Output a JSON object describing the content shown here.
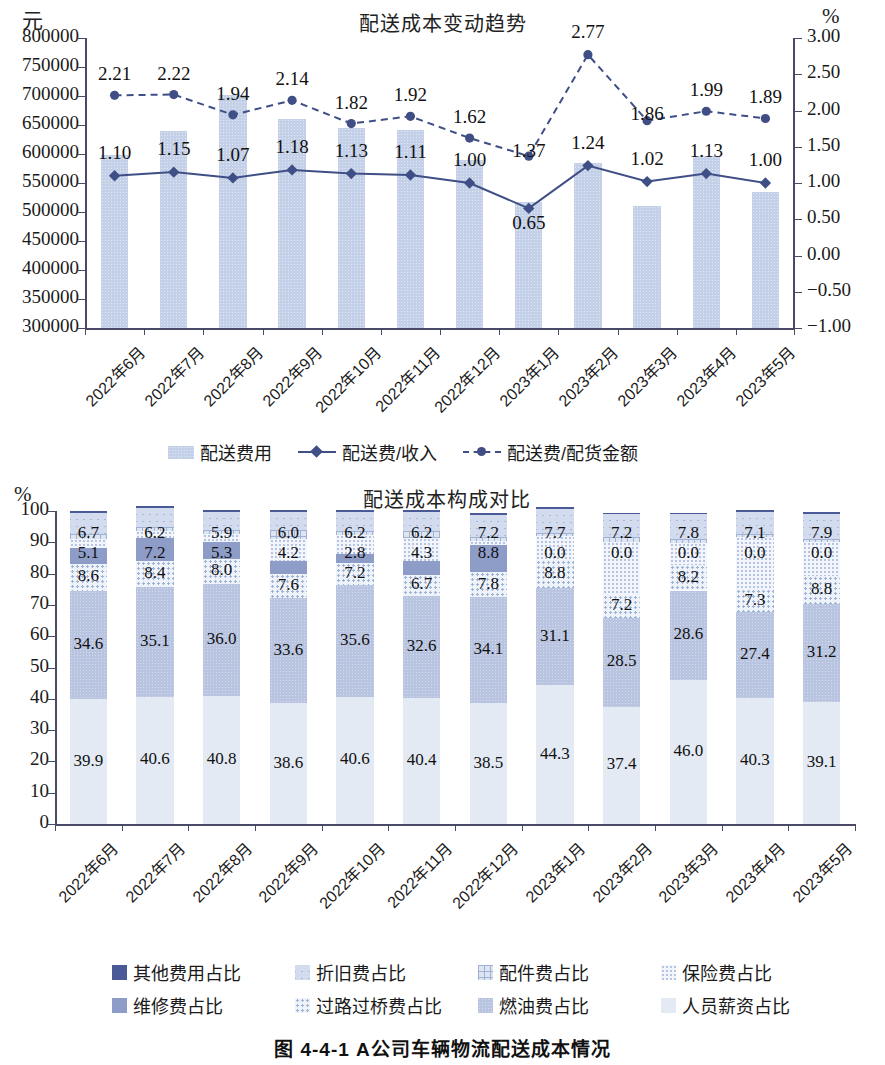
{
  "caption": "图 4-4-1    A公司车辆物流配送成本情况",
  "chart_data": [
    {
      "type": "bar",
      "title": "配送成本变动趋势",
      "xlabel": "",
      "ylabel": "元",
      "y2label": "%",
      "ylim": [
        300000,
        800000
      ],
      "yticks": [
        "300000",
        "350000",
        "400000",
        "450000",
        "500000",
        "550000",
        "600000",
        "650000",
        "700000",
        "750000",
        "800000"
      ],
      "y2lim": [
        -1.0,
        3.0
      ],
      "y2ticks": [
        "-1.00",
        "-0.50",
        "0.00",
        "0.50",
        "1.00",
        "1.50",
        "2.00",
        "2.50",
        "3.00"
      ],
      "grid": false,
      "legend_position": "bottom",
      "categories": [
        "2022年6月",
        "2022年7月",
        "2022年8月",
        "2022年9月",
        "2022年10月",
        "2022年11月",
        "2022年12月",
        "2023年1月",
        "2023年2月",
        "2023年3月",
        "2023年4月",
        "2023年5月"
      ],
      "series": [
        {
          "name": "配送费用",
          "kind": "bar",
          "axis": "left",
          "values": [
            598000,
            639000,
            702000,
            660000,
            645000,
            641000,
            590000,
            518000,
            584000,
            511000,
            596000,
            534000
          ]
        },
        {
          "name": "配送费/收入",
          "kind": "line-solid",
          "axis": "right",
          "values": [
            1.1,
            1.15,
            1.07,
            1.18,
            1.13,
            1.11,
            1.0,
            0.65,
            1.24,
            1.02,
            1.13,
            1.0
          ],
          "labels": [
            "1.10",
            "1.15",
            "1.07",
            "1.18",
            "1.13",
            "1.11",
            "1.00",
            "0.65",
            "1.24",
            "1.02",
            "1.13",
            "1.00"
          ]
        },
        {
          "name": "配送费/配货金额",
          "kind": "line-dashed",
          "axis": "right",
          "values": [
            2.21,
            2.22,
            1.94,
            2.14,
            1.82,
            1.92,
            1.62,
            1.37,
            2.77,
            1.86,
            1.99,
            1.89
          ],
          "labels": [
            "2.21",
            "2.22",
            "1.94",
            "2.14",
            "1.82",
            "1.92",
            "1.62",
            "1.37",
            "2.77",
            "1.86",
            "1.99",
            "1.89"
          ]
        }
      ]
    },
    {
      "type": "bar",
      "subtype": "stacked-100",
      "title": "配送成本构成对比",
      "xlabel": "",
      "ylabel": "%",
      "ylim": [
        0,
        100
      ],
      "yticks": [
        "0",
        "10",
        "20",
        "30",
        "40",
        "50",
        "60",
        "70",
        "80",
        "90",
        "100"
      ],
      "grid": false,
      "legend_position": "bottom",
      "categories": [
        "2022年6月",
        "2022年7月",
        "2022年8月",
        "2022年9月",
        "2022年10月",
        "2022年11月",
        "2022年12月",
        "2023年1月",
        "2023年2月",
        "2023年3月",
        "2023年4月",
        "2023年5月"
      ],
      "series": [
        {
          "name": "人员薪资占比",
          "color": "#e3eaf4",
          "pattern": "solid-light",
          "values": [
            39.9,
            40.6,
            40.8,
            38.6,
            40.6,
            40.4,
            38.5,
            44.3,
            37.4,
            46.0,
            40.3,
            39.1
          ],
          "labels": [
            "39.9",
            "40.6",
            "40.8",
            "38.6",
            "40.6",
            "40.4",
            "38.5",
            "44.3",
            "37.4",
            "46.0",
            "40.3",
            "39.1"
          ]
        },
        {
          "name": "燃油费占比",
          "color": "#b8c4e0",
          "pattern": "speckle",
          "values": [
            34.6,
            35.1,
            36.0,
            33.6,
            35.6,
            32.6,
            34.1,
            31.1,
            28.5,
            28.6,
            27.4,
            31.2
          ],
          "labels": [
            "34.6",
            "35.1",
            "36.0",
            "33.6",
            "35.6",
            "32.6",
            "34.1",
            "31.1",
            "28.5",
            "28.6",
            "27.4",
            "31.2"
          ]
        },
        {
          "name": "过路过桥费占比",
          "color": "#eef2f9",
          "pattern": "dots",
          "values": [
            8.6,
            8.4,
            8.0,
            7.6,
            7.2,
            6.7,
            7.8,
            8.8,
            7.2,
            8.2,
            7.3,
            8.8
          ],
          "labels": [
            "8.6",
            "8.4",
            "8.0",
            "7.6",
            "7.2",
            "6.7",
            "7.8",
            "8.8",
            "7.2",
            "8.2",
            "7.3",
            "8.8"
          ]
        },
        {
          "name": "维修费占比",
          "color": "#8e9cc8",
          "pattern": "solid-mid",
          "values": [
            5.1,
            7.2,
            5.3,
            4.2,
            2.8,
            4.3,
            8.8,
            0.0,
            0.0,
            0.0,
            0.0,
            0.0
          ],
          "labels": [
            "5.1",
            "7.2",
            "5.3",
            "4.2",
            "2.8",
            "4.3",
            "8.8",
            "0.0",
            "0.0",
            "0.0",
            "0.0",
            "0.0"
          ]
        },
        {
          "name": "保险费占比",
          "color": "#f2f5fb",
          "pattern": "fine-dots",
          "values": [
            3.0,
            2.3,
            2.7,
            7.2,
            6.2,
            7.4,
            1.2,
            7.7,
            17.0,
            6.9,
            16.6,
            11.1
          ],
          "labels": [
            "",
            "",
            "",
            "",
            "",
            "",
            "",
            "",
            "",
            "",
            "",
            ""
          ]
        },
        {
          "name": "配件费占比",
          "color": "#dde5f1",
          "pattern": "cross",
          "values": [
            1.5,
            1.2,
            1.0,
            2.6,
            1.2,
            2.2,
            1.2,
            1.2,
            1.6,
            1.4,
            1.1,
            1.0
          ],
          "labels": [
            "",
            "",
            "",
            "",
            "",
            "",
            "",
            "",
            "",
            "",
            "",
            ""
          ]
        },
        {
          "name": "折旧费占比",
          "color": "#d2dcee",
          "pattern": "x-hatch",
          "values": [
            6.7,
            6.2,
            5.9,
            6.0,
            6.2,
            6.2,
            7.2,
            7.7,
            7.2,
            7.8,
            7.1,
            7.9
          ],
          "labels": [
            "6.7",
            "6.2",
            "5.9",
            "6.0",
            "6.2",
            "6.2",
            "7.2",
            "7.7",
            "7.2",
            "7.8",
            "7.1",
            "7.9"
          ]
        },
        {
          "name": "其他费用占比",
          "color": "#4a5a96",
          "pattern": "solid-dark",
          "values": [
            0.6,
            0.6,
            0.6,
            0.6,
            0.6,
            0.6,
            0.6,
            0.6,
            0.6,
            0.6,
            0.6,
            0.6
          ],
          "labels": [
            "",
            "",
            "",
            "",
            "",
            "",
            "",
            "",
            "",
            "",
            "",
            ""
          ]
        }
      ]
    }
  ],
  "chart_top": {
    "title": "配送成本变动趋势",
    "unit_left": "元",
    "unit_right": "%",
    "legend": [
      {
        "label": "配送费用",
        "marker": "bar-swatch"
      },
      {
        "label": "配送费/收入",
        "marker": "solid-line-diamond"
      },
      {
        "label": "配送费/配货金额",
        "marker": "dashed-line-circle"
      }
    ]
  },
  "chart_bottom": {
    "title": "配送成本构成对比",
    "unit_left": "%",
    "legend_row1": [
      {
        "label": "其他费用占比",
        "swatch": "#4a5a96"
      },
      {
        "label": "折旧费占比",
        "swatch": "#d2dcee"
      },
      {
        "label": "配件费占比",
        "swatch": "#dde5f1"
      },
      {
        "label": "保险费占比",
        "swatch": "#f2f5fb"
      }
    ],
    "legend_row2": [
      {
        "label": "维修费占比",
        "swatch": "#8e9cc8"
      },
      {
        "label": "过路过桥费占比",
        "swatch": "#eef2f9"
      },
      {
        "label": "燃油费占比",
        "swatch": "#b8c4e0"
      },
      {
        "label": "人员薪资占比",
        "swatch": "#e3eaf4"
      }
    ]
  },
  "colors": {
    "line_primary": "#3f4f86",
    "bar_fill": "#c3d0e8",
    "axis": "#4a4a66"
  }
}
